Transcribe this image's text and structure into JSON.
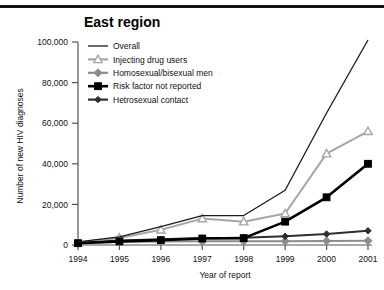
{
  "figure": {
    "title": "East region",
    "top_rule": true
  },
  "chart_data": {
    "type": "line",
    "title": "East region",
    "xlabel": "Year of report",
    "ylabel": "Number of new HIV diagnoses",
    "x": [
      1994,
      1995,
      1996,
      1997,
      1998,
      1999,
      2000,
      2001
    ],
    "xtick_labels": [
      "1994",
      "1995",
      "1996",
      "1997",
      "1998",
      "1999",
      "2000",
      "2001"
    ],
    "ytick_labels": [
      "0",
      "20,000",
      "40,000",
      "60,000",
      "80,000",
      "100,000"
    ],
    "ytick_values": [
      0,
      20000,
      40000,
      60000,
      80000,
      100000
    ],
    "ylim": [
      0,
      100000
    ],
    "xlim": [
      1994,
      2001
    ],
    "grid": false,
    "legend_position": "top-left",
    "series": [
      {
        "name": "Overall",
        "marker": "none",
        "color": "#1a1a1a",
        "values": [
          1500,
          4000,
          9000,
          14500,
          14500,
          27000,
          65000,
          101000
        ]
      },
      {
        "name": "Injecting drug users",
        "marker": "triangle",
        "color": "#a6a6a6",
        "values": [
          1200,
          3500,
          7500,
          13000,
          11500,
          15500,
          45000,
          56000
        ]
      },
      {
        "name": "Homosexual/bisexual men",
        "marker": "diamond",
        "color": "#8c8c8c",
        "values": [
          1000,
          1500,
          1700,
          1800,
          1800,
          1900,
          2000,
          2100
        ]
      },
      {
        "name": "Risk factor not reported",
        "marker": "square",
        "color": "#000000",
        "values": [
          900,
          1800,
          2400,
          3200,
          3400,
          11500,
          23500,
          40000
        ]
      },
      {
        "name": "Hetrosexual contact",
        "marker": "diamond-small",
        "color": "#2e2e2e",
        "values": [
          1100,
          2200,
          2800,
          3400,
          3600,
          4300,
          5400,
          7000
        ]
      }
    ]
  }
}
